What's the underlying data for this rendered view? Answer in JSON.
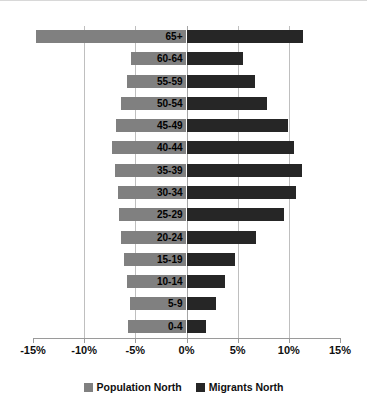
{
  "chart_data": {
    "type": "bar",
    "title": "",
    "subtitle": "",
    "xlabel": "",
    "ylabel": "",
    "orientation": "horizontal",
    "layout": "population-pyramid",
    "grid": true,
    "legend_position": "bottom",
    "xlim": [
      -15,
      15
    ],
    "xticks": [
      -15,
      -10,
      -5,
      0,
      5,
      10,
      15
    ],
    "xticklabels": [
      "-15%",
      "-10%",
      "-5%",
      "0%",
      "5%",
      "10%",
      "15%"
    ],
    "categories": [
      "0-4",
      "5-9",
      "10-14",
      "15-19",
      "20-24",
      "25-29",
      "30-34",
      "35-39",
      "40-44",
      "45-49",
      "50-54",
      "55-59",
      "60-64",
      "65+"
    ],
    "series": [
      {
        "name": "Population North",
        "color": "#808080",
        "side": "left",
        "values": [
          -5.7,
          -5.5,
          -5.8,
          -6.1,
          -6.4,
          -6.6,
          -6.7,
          -7.0,
          -7.3,
          -6.9,
          -6.4,
          -5.8,
          -5.4,
          -14.7
        ]
      },
      {
        "name": "Migrants North",
        "color": "#262626",
        "side": "right",
        "values": [
          1.9,
          2.9,
          3.8,
          4.7,
          6.8,
          9.5,
          10.7,
          11.3,
          10.5,
          9.9,
          7.9,
          6.7,
          5.5,
          11.4
        ]
      }
    ]
  },
  "legend": {
    "items": [
      {
        "label": "Population North",
        "swatch": "pop"
      },
      {
        "label": "Migrants North",
        "swatch": "mig"
      }
    ]
  }
}
